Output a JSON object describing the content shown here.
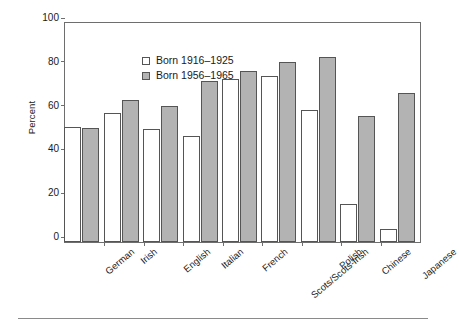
{
  "chart_data": {
    "type": "bar",
    "title": "",
    "subtitle": "",
    "xlabel": "",
    "ylabel": "Percent",
    "ylim": [
      0,
      100
    ],
    "yticks": [
      0,
      20,
      40,
      60,
      80,
      100
    ],
    "grid": false,
    "legend_position": "top-left",
    "categories": [
      "German",
      "Irish",
      "English",
      "Italian",
      "French",
      "Scots/Scots-Irish",
      "Polish",
      "Chinese",
      "Japanese"
    ],
    "series": [
      {
        "name": "Born 1916–1925",
        "color": "#ffffff",
        "values": [
          52.5,
          59,
          51.5,
          48.5,
          74.5,
          76,
          60.5,
          17.5,
          6
        ]
      },
      {
        "name": "Born 1956–1965",
        "color": "#b3b3b3",
        "values": [
          52,
          65,
          62,
          73.5,
          78,
          82,
          84.5,
          57.5,
          68
        ]
      }
    ]
  },
  "legend": {
    "items": [
      {
        "label": "Born 1916–1925",
        "swatch": "open-square"
      },
      {
        "label": "Born 1956–1965",
        "swatch": "filled-square"
      }
    ]
  },
  "axis": {
    "y_title": "Percent",
    "y_ticks": [
      "0",
      "20",
      "40",
      "60",
      "80",
      "100"
    ]
  },
  "colors": {
    "series_1_fill": "#ffffff",
    "series_2_fill": "#b3b3b3",
    "bar_stroke": "#555555",
    "frame": "#6e6e6e",
    "text": "#1a1a1a",
    "rule": "#8a8a8a"
  }
}
